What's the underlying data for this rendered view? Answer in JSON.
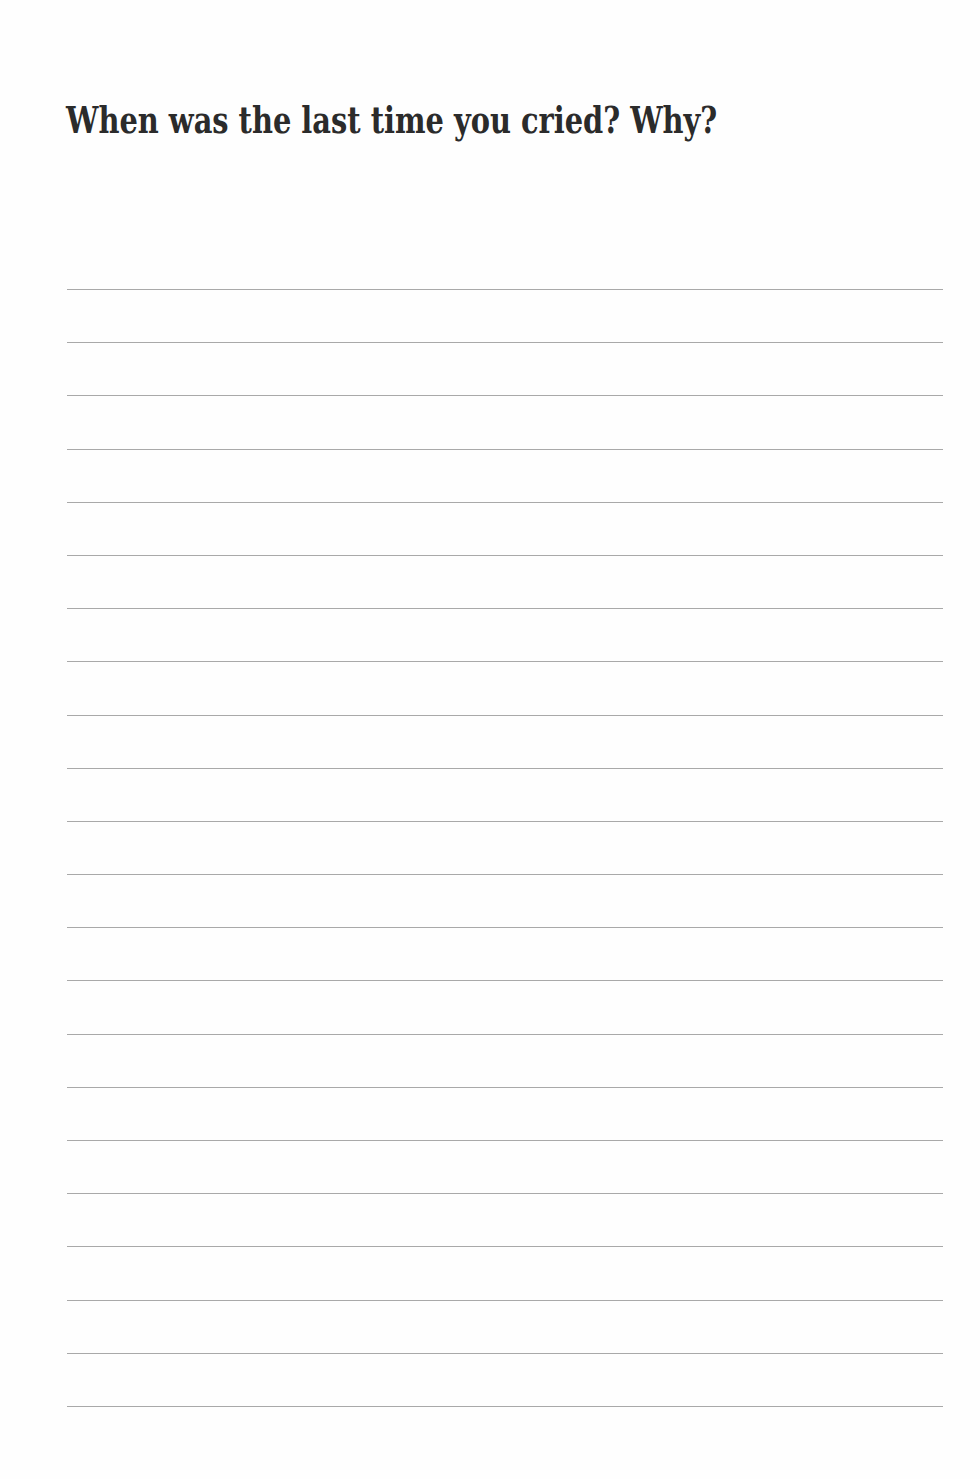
{
  "page": {
    "prompt": "When was the last time you cried? Why?",
    "writing_lines": {
      "count": 22,
      "color": "#9a9a9a"
    }
  }
}
